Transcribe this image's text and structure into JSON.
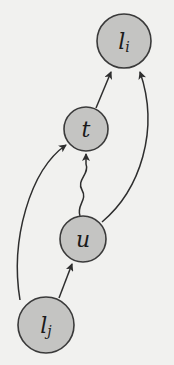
{
  "diagram": {
    "type": "directed-graph",
    "colors": {
      "background": "#f1f1ef",
      "node_fill": "#c4c4c2",
      "node_stroke": "#3a3a3a",
      "edge": "#2e2e2e"
    },
    "nodes": [
      {
        "id": "li",
        "label": "l",
        "subscript": "i"
      },
      {
        "id": "t",
        "label": "t",
        "subscript": ""
      },
      {
        "id": "u",
        "label": "u",
        "subscript": ""
      },
      {
        "id": "lj",
        "label": "l",
        "subscript": "j"
      }
    ],
    "edges": [
      {
        "from": "t",
        "to": "li",
        "style": "straight"
      },
      {
        "from": "u",
        "to": "li",
        "style": "curved"
      },
      {
        "from": "u",
        "to": "t",
        "style": "wavy"
      },
      {
        "from": "lj",
        "to": "t",
        "style": "curved"
      },
      {
        "from": "lj",
        "to": "u",
        "style": "straight"
      }
    ]
  }
}
